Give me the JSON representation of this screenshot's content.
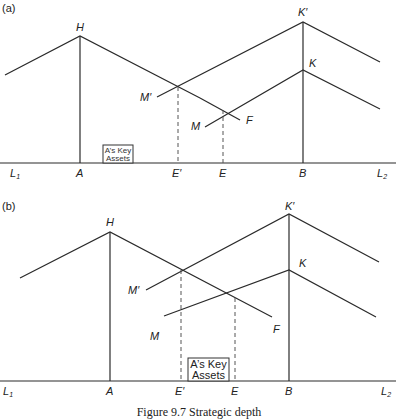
{
  "figure": {
    "caption": "Figure 9.7  Strategic depth",
    "panels": [
      {
        "id": "a",
        "tag": "(a)",
        "labels": {
          "H": "H",
          "K_prime": "K′",
          "K": "K",
          "M_prime": "M′",
          "M": "M",
          "F": "F",
          "L1": "L",
          "L1_sub": "1",
          "L2": "L",
          "L2_sub": "2",
          "A": "A",
          "E_prime": "E′",
          "E": "E",
          "B": "B"
        },
        "box": {
          "line1": "A’s Key",
          "line2": "Assets"
        }
      },
      {
        "id": "b",
        "tag": "(b)",
        "labels": {
          "H": "H",
          "K_prime": "K′",
          "K": "K",
          "M_prime": "M′",
          "M": "M",
          "F": "F",
          "L1": "L",
          "L1_sub": "1",
          "L2": "L",
          "L2_sub": "2",
          "A": "A",
          "E_prime": "E′",
          "E": "E",
          "B": "B"
        },
        "box": {
          "line1": "A’s Key",
          "line2": "Assets"
        }
      }
    ]
  }
}
